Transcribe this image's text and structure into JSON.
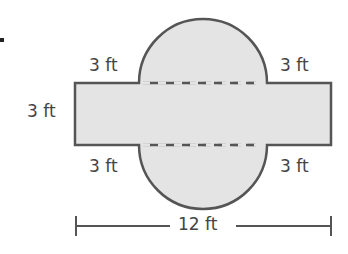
{
  "figure": {
    "marker": ".",
    "labels": {
      "top_left": "3 ft",
      "top_right": "3 ft",
      "left_height": "3 ft",
      "bottom_left": "3 ft",
      "bottom_right": "3 ft",
      "total_width": "12 ft"
    },
    "colors": {
      "fill": "#e4e4e4",
      "stroke": "#555555",
      "text": "#444444"
    }
  }
}
